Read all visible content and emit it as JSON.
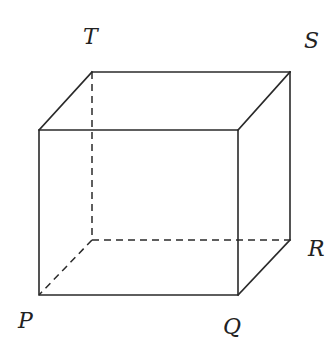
{
  "diagram": {
    "type": "cube",
    "labels": {
      "T": "T",
      "S": "S",
      "R": "R",
      "P": "P",
      "Q": "Q"
    },
    "vertices": {
      "back_top_left": [
        92,
        72
      ],
      "back_top_right": [
        290,
        72
      ],
      "front_top_left": [
        39,
        130
      ],
      "front_top_right": [
        238,
        130
      ],
      "front_bottom_left": [
        39,
        295
      ],
      "front_bottom_right": [
        238,
        295
      ],
      "back_bottom_right": [
        290,
        240
      ],
      "back_bottom_left": [
        92,
        240
      ]
    },
    "colors": {
      "line": "#2a2a2a",
      "text": "#222222",
      "background": "#ffffff"
    }
  }
}
